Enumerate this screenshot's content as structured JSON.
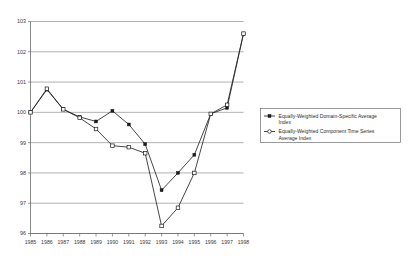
{
  "chart_data": {
    "type": "line",
    "title": "",
    "subtitle": "",
    "xlabel": "",
    "ylabel": "",
    "grid": true,
    "legend_position": "right",
    "categories": [
      "1985",
      "1986",
      "1987",
      "1988",
      "1989",
      "1990",
      "1991",
      "1992",
      "1993",
      "1994",
      "1995",
      "1996",
      "1997",
      "1998"
    ],
    "x": [
      1985,
      1986,
      1987,
      1988,
      1989,
      1990,
      1991,
      1992,
      1993,
      1994,
      1995,
      1996,
      1997,
      1998
    ],
    "xlim": [
      1985,
      1998
    ],
    "ylim": [
      96,
      103
    ],
    "yticks": [
      96,
      97,
      98,
      99,
      100,
      101,
      102,
      103
    ],
    "ytick_labels": [
      "96",
      "97",
      "98",
      "99",
      "100",
      "101",
      "102",
      "103"
    ],
    "series": [
      {
        "name": "Equally-Weighted Domain-Specific Average Index",
        "marker": "filled-square",
        "values": [
          100.0,
          100.75,
          100.1,
          99.85,
          99.7,
          100.05,
          99.6,
          98.95,
          97.43,
          98.0,
          98.6,
          99.95,
          100.15,
          102.6
        ]
      },
      {
        "name": "Equally-Weighted Component Time Series Average Index",
        "marker": "open-square",
        "values": [
          100.0,
          100.78,
          100.1,
          99.82,
          99.45,
          98.9,
          98.85,
          98.65,
          96.25,
          96.85,
          98.0,
          99.95,
          100.25,
          102.6
        ]
      }
    ]
  },
  "legend": {
    "entries": [
      {
        "line1": "Equally-Weighted Domain-Specific Average",
        "line2": "Index",
        "marker": "filled-square"
      },
      {
        "line1": "Equally-Weighted Component Time Series",
        "line2": "Average Index",
        "marker": "open-square"
      }
    ]
  },
  "colors": {
    "line": "#262626",
    "grid": "#8f8f8f",
    "axis": "#6b6b6b",
    "text": "#3a3a3a",
    "background": "#ffffff"
  }
}
